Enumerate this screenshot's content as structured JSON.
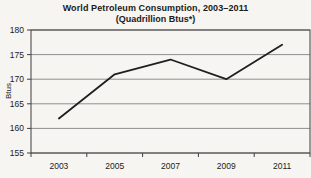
{
  "chart_data": {
    "type": "line",
    "title": "World Petroleum Consumption, 2003–2011",
    "subtitle": "(Quadrillion Btus*)",
    "ylabel": "Btus",
    "xlabel": "",
    "categories": [
      "2003",
      "2005",
      "2007",
      "2009",
      "2011"
    ],
    "series": [
      {
        "name": "World Petroleum Consumption",
        "values": [
          162,
          171,
          174,
          170,
          177
        ]
      }
    ],
    "ylim": [
      155,
      180
    ],
    "yticks": [
      155,
      160,
      165,
      170,
      175,
      180
    ],
    "grid": true,
    "legend": "none",
    "colors": {
      "line": "#1f1f1f",
      "gridline": "#8f8f8f",
      "axis_border": "#3f3f3f",
      "background": "#f6f5f2",
      "text": "#1b1b1b"
    }
  }
}
